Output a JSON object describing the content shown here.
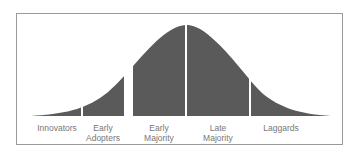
{
  "diagram": {
    "title": "",
    "type": "bell-curve segmented",
    "fill_color": "#5a5a5a",
    "segments": [
      {
        "label": "Innovators",
        "line1": "Innovators",
        "line2": "",
        "x_start": 31,
        "x_end": 81,
        "label_x": 57
      },
      {
        "label": "Early Adopters",
        "line1": "Early",
        "line2": "Adopters",
        "x_start": 83,
        "x_end": 124,
        "label_x": 103
      },
      {
        "label": "Early Majority",
        "line1": "Early",
        "line2": "Majority",
        "x_start": 133,
        "x_end": 185,
        "label_x": 159
      },
      {
        "label": "Late Majority",
        "line1": "Late",
        "line2": "Majority",
        "x_start": 187,
        "x_end": 249,
        "label_x": 218
      },
      {
        "label": "Laggards",
        "line1": "Laggards",
        "line2": "",
        "x_start": 251,
        "x_end": 331,
        "label_x": 281
      }
    ]
  }
}
